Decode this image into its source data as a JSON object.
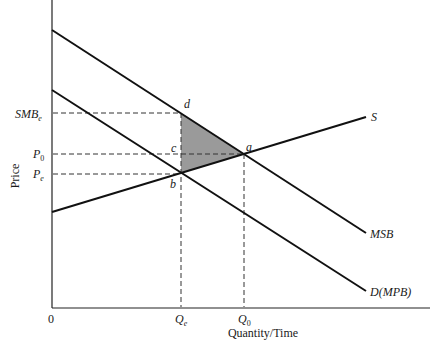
{
  "diagram": {
    "type": "economics-externality-diagram",
    "axes": {
      "y_label": "Price",
      "x_label": "Quantity/Time",
      "origin_label": "0"
    },
    "price_labels": [
      {
        "id": "smb_e",
        "main": "SMB",
        "sub": "e"
      },
      {
        "id": "p0",
        "main": "P",
        "sub": "0"
      },
      {
        "id": "pe",
        "main": "P",
        "sub": "e"
      }
    ],
    "quantity_labels": [
      {
        "id": "qe",
        "main": "Q",
        "sub": "e"
      },
      {
        "id": "q0",
        "main": "Q",
        "sub": "0"
      }
    ],
    "curves": [
      {
        "id": "supply",
        "label": "S"
      },
      {
        "id": "msb",
        "label": "MSB"
      },
      {
        "id": "demand",
        "label": "D(MPB)"
      }
    ],
    "points": [
      {
        "id": "a",
        "label": "a"
      },
      {
        "id": "b",
        "label": "b"
      },
      {
        "id": "c",
        "label": "c"
      },
      {
        "id": "d",
        "label": "d"
      }
    ],
    "shaded_region": {
      "vertices": [
        "d",
        "a",
        "b"
      ],
      "color": "#9a9a9a"
    },
    "colors": {
      "line": "#111111",
      "dashed": "#333333",
      "shade": "#9a9a9a"
    }
  }
}
